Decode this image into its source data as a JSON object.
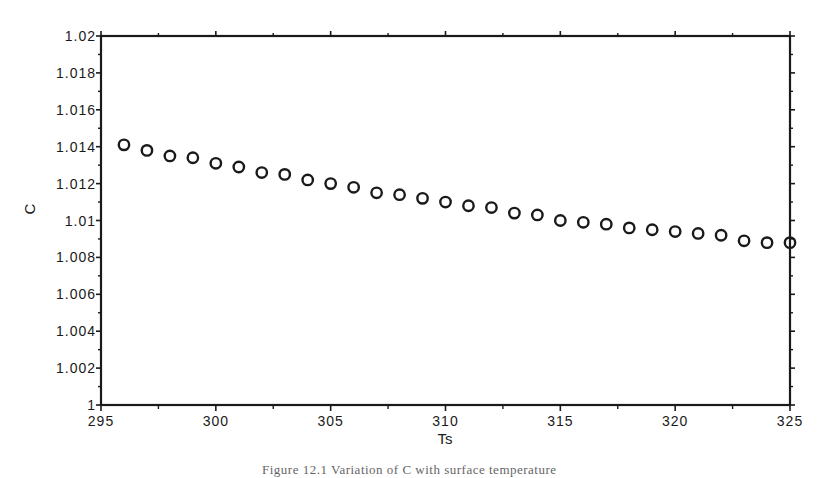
{
  "chart_data": {
    "type": "scatter",
    "title": "",
    "xlabel": "Ts",
    "ylabel": "C",
    "xlim": [
      295,
      325
    ],
    "ylim": [
      1.0,
      1.02
    ],
    "grid": false,
    "legend": null,
    "marker": "open-circle",
    "x_ticks": [
      295,
      300,
      305,
      310,
      315,
      320,
      325
    ],
    "x_tick_labels": [
      "295",
      "300",
      "305",
      "310",
      "315",
      "320",
      "325"
    ],
    "y_ticks": [
      1.0,
      1.002,
      1.004,
      1.006,
      1.008,
      1.01,
      1.012,
      1.014,
      1.016,
      1.018,
      1.02
    ],
    "y_tick_labels": [
      "1",
      "1.002",
      "1.004",
      "1.006",
      "1.008",
      "1.01",
      "1.012",
      "1.014",
      "1.016",
      "1.018",
      "1.02"
    ],
    "series": [
      {
        "name": "C",
        "x": [
          296,
          297,
          298,
          299,
          300,
          301,
          302,
          303,
          304,
          305,
          306,
          307,
          308,
          309,
          310,
          311,
          312,
          313,
          314,
          315,
          316,
          317,
          318,
          319,
          320,
          321,
          322,
          323,
          324,
          325
        ],
        "y": [
          1.0141,
          1.0138,
          1.0135,
          1.0134,
          1.0131,
          1.0129,
          1.0126,
          1.0125,
          1.0122,
          1.012,
          1.0118,
          1.0115,
          1.0114,
          1.0112,
          1.011,
          1.0108,
          1.0107,
          1.0104,
          1.0103,
          1.01,
          1.0099,
          1.0098,
          1.0096,
          1.0095,
          1.0094,
          1.0093,
          1.0092,
          1.0089,
          1.0088,
          1.0088
        ]
      }
    ]
  },
  "caption": {
    "text": "Figure 12.1   Variation of C with surface temperature"
  },
  "colors": {
    "ink": "#1a1a1a",
    "background": "#ffffff"
  }
}
